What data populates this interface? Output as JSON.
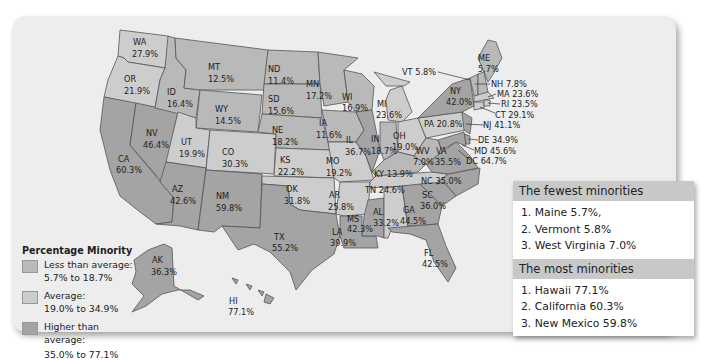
{
  "legend": {
    "title": "Percentage Minority",
    "items": [
      {
        "label": "Less than average:",
        "range": "5.7% to 18.7%",
        "color": "#b9b9b9"
      },
      {
        "label": "Average:",
        "range": "19.0% to 34.9%",
        "color": "#cdcdcd"
      },
      {
        "label": "Higher than average:",
        "range": "35.0% to 77.1%",
        "color": "#a4a4a4"
      }
    ]
  },
  "states": {
    "WA": {
      "abbr": "WA",
      "value": "27.9%"
    },
    "OR": {
      "abbr": "OR",
      "value": "21.9%"
    },
    "CA": {
      "abbr": "CA",
      "value": "60.3%"
    },
    "NV": {
      "abbr": "NV",
      "value": "46.4%"
    },
    "ID": {
      "abbr": "ID",
      "value": "16.4%"
    },
    "MT": {
      "abbr": "MT",
      "value": "12.5%"
    },
    "WY": {
      "abbr": "WY",
      "value": "14.5%"
    },
    "UT": {
      "abbr": "UT",
      "value": "19.9%"
    },
    "CO": {
      "abbr": "CO",
      "value": "30.3%"
    },
    "AZ": {
      "abbr": "AZ",
      "value": "42.6%"
    },
    "NM": {
      "abbr": "NM",
      "value": "59.8%"
    },
    "ND": {
      "abbr": "ND",
      "value": "11.4%"
    },
    "SD": {
      "abbr": "SD",
      "value": "15.6%"
    },
    "NE": {
      "abbr": "NE",
      "value": "18.2%"
    },
    "KS": {
      "abbr": "KS",
      "value": "22.2%"
    },
    "OK": {
      "abbr": "OK",
      "value": "31.8%"
    },
    "TX": {
      "abbr": "TX",
      "value": "55.2%"
    },
    "MN": {
      "abbr": "MN",
      "value": "17.2%"
    },
    "IA": {
      "abbr": "IA",
      "value": "11.6%"
    },
    "MO": {
      "abbr": "MO",
      "value": "19.2%"
    },
    "AR": {
      "abbr": "AR",
      "value": "25.8%"
    },
    "LA": {
      "abbr": "LA",
      "value": "39.9%"
    },
    "WI": {
      "abbr": "WI",
      "value": "16.9%"
    },
    "IL": {
      "abbr": "IL",
      "value": "36.7%"
    },
    "MS": {
      "abbr": "MS",
      "value": "42.3%"
    },
    "MI": {
      "abbr": "MI",
      "value": "23.6%"
    },
    "IN": {
      "abbr": "IN",
      "value": "18.7%"
    },
    "OH": {
      "abbr": "OH",
      "value": "19.0%"
    },
    "KY": {
      "abbr": "KY",
      "value": "13.9%"
    },
    "TN": {
      "abbr": "TN",
      "value": "24.6%"
    },
    "AL": {
      "abbr": "AL",
      "value": "33.2%"
    },
    "GA": {
      "abbr": "GA",
      "value": "44.5%"
    },
    "FL": {
      "abbr": "FL",
      "value": "42.5%"
    },
    "SC": {
      "abbr": "SC",
      "value": "36.0%"
    },
    "NC": {
      "abbr": "NC",
      "value": "35.0%"
    },
    "VA": {
      "abbr": "VA",
      "value": "35.5%"
    },
    "WV": {
      "abbr": "WV",
      "value": "7.0%"
    },
    "PA": {
      "abbr": "PA",
      "value": "20.8%"
    },
    "NY": {
      "abbr": "NY",
      "value": "42.0%"
    },
    "VT": {
      "abbr": "VT",
      "value": "5.8%"
    },
    "ME": {
      "abbr": "ME",
      "value": "5.7%"
    },
    "NH": {
      "abbr": "NH",
      "value": "7.8%"
    },
    "MA": {
      "abbr": "MA",
      "value": "23.6%"
    },
    "RI": {
      "abbr": "RI",
      "value": "23.5%"
    },
    "CT": {
      "abbr": "CT",
      "value": "29.1%"
    },
    "NJ": {
      "abbr": "NJ",
      "value": "41.1%"
    },
    "DE": {
      "abbr": "DE",
      "value": "34.9%"
    },
    "MD": {
      "abbr": "MD",
      "value": "45.6%"
    },
    "DC": {
      "abbr": "DC",
      "value": "64.7%"
    },
    "AK": {
      "abbr": "AK",
      "value": "36.3%"
    },
    "HI": {
      "abbr": "HI",
      "value": "77.1%"
    }
  },
  "rankings": {
    "fewest": {
      "title": "The fewest minorities",
      "items": [
        "1. Maine 5.7%,",
        "2. Vermont 5.8%",
        "3. West Virginia 7.0%"
      ]
    },
    "most": {
      "title": "The most minorities",
      "items": [
        "1. Hawaii 77.1%",
        "2. California 60.3%",
        "3. New Mexico 59.8%"
      ]
    }
  }
}
